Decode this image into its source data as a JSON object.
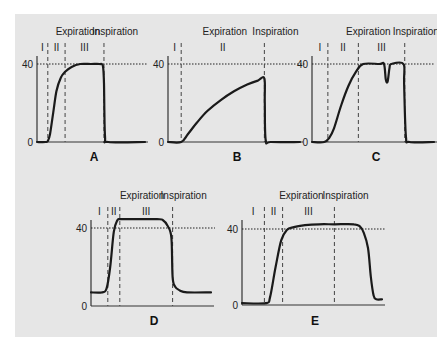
{
  "colors": {
    "background": "#e6e6e6",
    "curve": "#1a1a1a",
    "axis": "#333333",
    "reference_line": "#222222",
    "phase_divider": "#444444"
  },
  "chart_data": [
    {
      "type": "line",
      "panel_label": "A",
      "title": "",
      "xlabel": "",
      "ylabel": "",
      "yticks": [
        "0",
        "40"
      ],
      "ylim": [
        0,
        50
      ],
      "reference_line": {
        "y": 40,
        "style": "dotted"
      },
      "phase_labels": [
        "I",
        "II",
        "III"
      ],
      "header_labels": {
        "expiration": "Expiration",
        "inspiration": "Inspiration"
      },
      "phase_boundaries_x": [
        0.1,
        0.26,
        0.62
      ],
      "series": [
        {
          "name": "CO2",
          "x": [
            0,
            0.08,
            0.1,
            0.12,
            0.15,
            0.18,
            0.22,
            0.26,
            0.32,
            0.4,
            0.5,
            0.58,
            0.61,
            0.62,
            0.63,
            0.66,
            1.0
          ],
          "y": [
            0,
            0,
            0.5,
            4,
            15,
            26,
            33,
            36,
            38.5,
            40,
            40,
            40,
            39,
            30,
            3,
            0,
            0
          ]
        }
      ]
    },
    {
      "type": "line",
      "panel_label": "B",
      "title": "",
      "xlabel": "",
      "ylabel": "",
      "yticks": [
        "0",
        "40"
      ],
      "ylim": [
        0,
        50
      ],
      "reference_line": {
        "y": 40,
        "style": "dotted"
      },
      "phase_labels": [
        "I",
        "II"
      ],
      "header_labels": {
        "expiration": "Expiration",
        "inspiration": "Inspiration"
      },
      "phase_boundaries_x": [
        0.1,
        0.73
      ],
      "series": [
        {
          "name": "CO2",
          "x": [
            0,
            0.1,
            0.15,
            0.22,
            0.3,
            0.4,
            0.5,
            0.6,
            0.68,
            0.73,
            0.733,
            0.74,
            0.78,
            1.0
          ],
          "y": [
            0,
            0,
            4,
            10,
            16,
            21.5,
            26,
            29.5,
            31.5,
            32.5,
            20,
            1,
            0,
            0
          ]
        }
      ]
    },
    {
      "type": "line",
      "panel_label": "C",
      "title": "",
      "xlabel": "",
      "ylabel": "",
      "yticks": [
        "0",
        "40"
      ],
      "ylim": [
        0,
        50
      ],
      "reference_line": {
        "y": 40,
        "style": "dotted"
      },
      "phase_labels": [
        "I",
        "II",
        "III"
      ],
      "header_labels": {
        "expiration": "Expiration",
        "inspiration": "Inspiration"
      },
      "phase_boundaries_x": [
        0.13,
        0.38,
        0.76
      ],
      "series": [
        {
          "name": "CO2",
          "x": [
            0,
            0.1,
            0.14,
            0.18,
            0.24,
            0.3,
            0.36,
            0.42,
            0.55,
            0.59,
            0.605,
            0.62,
            0.635,
            0.65,
            0.75,
            0.755,
            0.77,
            0.8,
            1.0
          ],
          "y": [
            0,
            0,
            2,
            7,
            19,
            29,
            36,
            40,
            40,
            40,
            32,
            31,
            38,
            40,
            40,
            30,
            3,
            0,
            0
          ]
        }
      ]
    },
    {
      "type": "line",
      "panel_label": "D",
      "title": "",
      "xlabel": "",
      "ylabel": "",
      "yticks": [
        "0",
        "40"
      ],
      "ylim": [
        0,
        55
      ],
      "reference_line": {
        "y": 40,
        "style": "dotted"
      },
      "phase_labels": [
        "I",
        "II",
        "III"
      ],
      "header_labels": {
        "expiration": "Expiration",
        "inspiration": "Inspiration"
      },
      "phase_boundaries_x": [
        0.14,
        0.24,
        0.68
      ],
      "series": [
        {
          "name": "CO2",
          "x": [
            0,
            0.09,
            0.13,
            0.16,
            0.19,
            0.22,
            0.24,
            0.3,
            0.55,
            0.6,
            0.64,
            0.67,
            0.68,
            0.7,
            0.74,
            0.8,
            1.0
          ],
          "y": [
            7,
            7,
            9,
            20,
            38,
            44,
            44.5,
            44.5,
            44.5,
            44,
            41,
            35,
            15,
            10,
            8,
            7,
            7
          ]
        }
      ]
    },
    {
      "type": "line",
      "panel_label": "E",
      "title": "",
      "xlabel": "",
      "ylabel": "",
      "yticks": [
        "0",
        "40"
      ],
      "ylim": [
        0,
        50
      ],
      "reference_line": {
        "y": 40,
        "style": "dotted"
      },
      "phase_labels": [
        "I",
        "II",
        "III"
      ],
      "header_labels": {
        "expiration": "Expiration",
        "inspiration": "Inspiration"
      },
      "phase_boundaries_x": [
        0.16,
        0.29,
        0.66
      ],
      "series": [
        {
          "name": "CO2",
          "x": [
            0,
            0.17,
            0.2,
            0.24,
            0.28,
            0.32,
            0.37,
            0.45,
            0.55,
            0.66,
            0.8,
            0.84,
            0.87,
            0.9,
            0.92,
            0.94,
            0.96,
            1.0
          ],
          "y": [
            1,
            1,
            4,
            20,
            34,
            39.5,
            41,
            42,
            42.5,
            42.5,
            42.5,
            41.5,
            38,
            30,
            15,
            5,
            3,
            3
          ]
        }
      ]
    }
  ]
}
